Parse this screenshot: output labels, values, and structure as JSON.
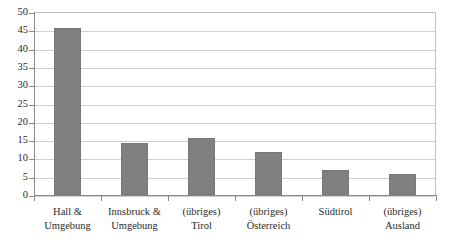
{
  "chart_data": {
    "type": "bar",
    "title": "",
    "subtitle": "",
    "xlabel": "",
    "ylabel": "",
    "ylim": [
      0,
      50
    ],
    "ytick_step": 5,
    "yticks": [
      50,
      45,
      40,
      35,
      30,
      25,
      20,
      15,
      10,
      5,
      0
    ],
    "ytick_labels": [
      "50",
      "45",
      "40",
      "35",
      "30",
      "25",
      "20",
      "15",
      "10",
      "5",
      "0"
    ],
    "grid": true,
    "grid_axis": "y",
    "legend": false,
    "legend_position": "none",
    "categories": [
      "Hall & Umgebung",
      "Innsbruck & Umgebung",
      "(übriges) Tirol",
      "(übriges) Österreich",
      "Südtirol",
      "(übriges) Ausland"
    ],
    "category_lines": [
      [
        "Hall &",
        "Umgebung"
      ],
      [
        "Innsbruck &",
        "Umgebung"
      ],
      [
        "(übriges)",
        "Tirol"
      ],
      [
        "(übriges)",
        "Österreich"
      ],
      [
        "Südtirol",
        ""
      ],
      [
        "(übriges)",
        "Ausland"
      ]
    ],
    "values": [
      45.6,
      14.1,
      15.5,
      11.8,
      6.7,
      5.7
    ],
    "bar_color": "#808080",
    "bar_edge_color": "#787878",
    "gridline_color": "#cfcfcf",
    "axis_color": "#8a8a8a",
    "plot_border_color": "#bfbfbf",
    "background_color": "#ffffff",
    "text_color": "#2b2b2b"
  }
}
